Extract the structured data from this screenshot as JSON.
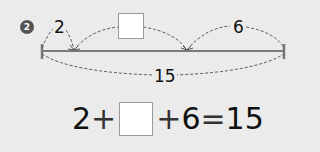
{
  "problem": {
    "number": "2",
    "diagram": {
      "segment_left_label": "2",
      "segment_middle_label": "",
      "segment_right_label": "6",
      "total_label": "15"
    },
    "equation": {
      "term1": "2",
      "op1": "+",
      "blank": "",
      "op2": "+",
      "term3": "6",
      "equals": "=",
      "result": "15"
    }
  }
}
